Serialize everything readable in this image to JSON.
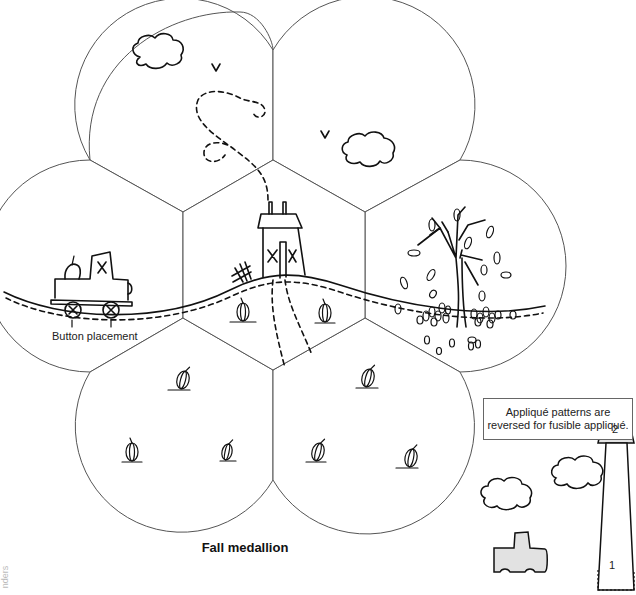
{
  "title": "Fall medallion",
  "labels": {
    "button_placement": "Button placement"
  },
  "note": {
    "line1": "Appliqué patterns are",
    "line2": "reversed for fusible appliqué."
  },
  "pattern_pieces": {
    "house_roof_number": "2",
    "house_body_number": "1"
  },
  "credit_text": "nders",
  "colors": {
    "outline": "#555555",
    "ink": "#111111",
    "piece_fill": "#e2e2e2",
    "background": "#ffffff"
  },
  "sections": [
    {
      "name": "top-left-petal",
      "contents": [
        "cloud",
        "bird",
        "dashed flight path"
      ]
    },
    {
      "name": "top-right-petal",
      "contents": [
        "cloud",
        "bird"
      ]
    },
    {
      "name": "left-petal",
      "contents": [
        "truck with pumpkin",
        "buttons x2",
        "hill"
      ]
    },
    {
      "name": "center-hexagon",
      "contents": [
        "house",
        "fence",
        "path",
        "pumpkins x2"
      ]
    },
    {
      "name": "right-petal",
      "contents": [
        "autumn tree",
        "falling leaves",
        "leaf piles"
      ]
    },
    {
      "name": "bottom-left-petal",
      "contents": [
        "pumpkins x3"
      ]
    },
    {
      "name": "bottom-right-petal",
      "contents": [
        "pumpkins x3"
      ]
    }
  ]
}
